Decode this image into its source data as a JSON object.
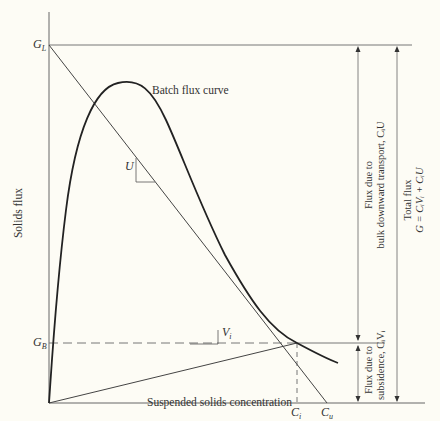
{
  "diagram": {
    "y_axis_label": "Solids flux",
    "x_axis_label": "Suspended solids concentration",
    "curve_label": "Batch flux curve",
    "labels": {
      "GL": "G",
      "GL_sub": "L",
      "GB": "G",
      "GB_sub": "B",
      "U": "U",
      "Vi": "V",
      "Vi_sub": "i",
      "Ci": "C",
      "Ci_sub": "i",
      "Cu": "C",
      "Cu_sub": "u"
    },
    "annotations": {
      "bulk_line1": "Flux due to",
      "bulk_line2": "bulk downward transport, CᵢU",
      "subsidence_line1": "Flux due to",
      "subsidence_line2": "subsidence, CᵢVᵢ",
      "total_line1": "Total flux",
      "total_line2": "G = CᵢVᵢ + CᵢU"
    },
    "colors": {
      "line": "#555555",
      "curve": "#222222",
      "background": "#fdfcf5"
    }
  }
}
